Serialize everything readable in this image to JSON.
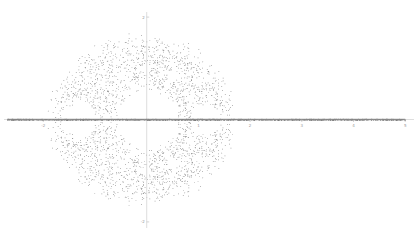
{
  "chart_data": {
    "type": "scatter",
    "title": "",
    "xlabel": "",
    "ylabel": "",
    "xlim": [
      -2.8,
      5.1
    ],
    "ylim": [
      -2.3,
      2.3
    ],
    "grid": false,
    "legend": null,
    "x_ticks": [
      {
        "value": -2,
        "label": "-2"
      },
      {
        "value": 1,
        "label": "1"
      },
      {
        "value": 2,
        "label": "2"
      },
      {
        "value": 3,
        "label": "3"
      },
      {
        "value": 4,
        "label": "4"
      },
      {
        "value": 5,
        "label": "5"
      }
    ],
    "y_ticks": [
      {
        "value": 2,
        "label": "2"
      },
      {
        "value": -2,
        "label": "-2"
      }
    ],
    "series": [
      {
        "name": "points",
        "color": "#5a5a5a",
        "cloud": {
          "cx": -0.1,
          "cy": 0,
          "rx": 1.7,
          "ry": 1.55,
          "count": 9000
        },
        "holes": [
          {
            "x": 0.0,
            "y": 0.0,
            "r": 0.62
          },
          {
            "x": -1.3,
            "y": 0.0,
            "r": 0.33
          },
          {
            "x": 1.15,
            "y": 0.0,
            "r": 0.3
          },
          {
            "x": 0.0,
            "y": 1.02,
            "r": 0.07
          },
          {
            "x": 0.0,
            "y": -1.02,
            "r": 0.07
          },
          {
            "x": -0.5,
            "y": 0.85,
            "r": 0.07
          },
          {
            "x": 0.5,
            "y": 0.85,
            "r": 0.08
          },
          {
            "x": -0.5,
            "y": -0.85,
            "r": 0.07
          },
          {
            "x": 0.5,
            "y": -0.85,
            "r": 0.08
          },
          {
            "x": 0.9,
            "y": 0.75,
            "r": 0.04
          },
          {
            "x": 0.9,
            "y": -0.75,
            "r": 0.04
          }
        ],
        "real_axis_points": {
          "from": -2.7,
          "to": 5.0,
          "count": 1400
        }
      }
    ],
    "axis_color": "#c8c8c8",
    "real_axis_line_color": "#777777"
  }
}
